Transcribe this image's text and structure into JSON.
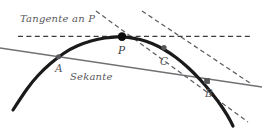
{
  "figure": {
    "title_text": "Tangente an P",
    "secant_text": "Sekante",
    "width": 262,
    "height": 129,
    "background": "#ffffff"
  },
  "labels": {
    "tangente": "Tangente an P",
    "sekante": "Sekante",
    "point_p": "P",
    "point_a": "A",
    "point_b": "B",
    "point_c": "C"
  },
  "colors": {
    "curve": "#1a1a1a",
    "secant": "#6f7174",
    "dashed": "#5d5e61",
    "tangent_dash": "#3c3d3f",
    "label": "#58595b",
    "point_fill_major": "#0d0d0d",
    "point_fill_minor": "#55575a"
  },
  "chart_data": {
    "type": "line",
    "title": "Tangente an P",
    "xlabel": "",
    "ylabel": "",
    "xlim": [
      0,
      262
    ],
    "ylim": [
      129,
      0
    ],
    "grid": false,
    "legend": null,
    "series": [
      {
        "name": "Kurve",
        "kind": "curve",
        "style": "solid",
        "width": 3.2,
        "color": "#1a1a1a",
        "points": [
          [
            13,
            110
          ],
          [
            22,
            96
          ],
          [
            32,
            82
          ],
          [
            44,
            69
          ],
          [
            57,
            58
          ],
          [
            70,
            49
          ],
          [
            84,
            43
          ],
          [
            98,
            39
          ],
          [
            112,
            37
          ],
          [
            122,
            36.6
          ],
          [
            134,
            38
          ],
          [
            146,
            41
          ],
          [
            158,
            46
          ],
          [
            170,
            53
          ],
          [
            182,
            62
          ],
          [
            194,
            73
          ],
          [
            206,
            86
          ],
          [
            218,
            101
          ],
          [
            228,
            116
          ],
          [
            233,
            126
          ]
        ]
      },
      {
        "name": "Tangente an P",
        "kind": "line",
        "style": "dashed",
        "width": 1.3,
        "dash": "5,3.4",
        "color": "#3c3d3f",
        "points": [
          [
            18,
            36.4
          ],
          [
            250,
            36.4
          ]
        ]
      },
      {
        "name": "Sekante AB",
        "kind": "line",
        "style": "solid",
        "width": 1.5,
        "color": "#6f7174",
        "points": [
          [
            0,
            48
          ],
          [
            262,
            87
          ]
        ]
      },
      {
        "name": "Sekante PC (gestrichelt)",
        "kind": "line",
        "style": "dashed",
        "width": 1.25,
        "dash": "4.6,3.2",
        "color": "#5d5e61",
        "points": [
          [
            96,
            11
          ],
          [
            248,
            122
          ]
        ]
      },
      {
        "name": "Sekante PB (gestrichelt)",
        "kind": "line",
        "style": "dashed",
        "width": 1.25,
        "dash": "4.6,3.2",
        "color": "#5d5e61",
        "points": [
          [
            142,
            11
          ],
          [
            250,
            83
          ]
        ]
      }
    ],
    "points": [
      {
        "label": "P",
        "x": 122,
        "y": 36.6,
        "radius": 4.3,
        "fill": "#0d0d0d",
        "shape": "circle"
      },
      {
        "label": "C",
        "x": 164,
        "y": 47.6,
        "radius": 2.6,
        "fill": "#55575a",
        "shape": "circle"
      },
      {
        "label": "A",
        "x": 58.5,
        "y": 56.8,
        "radius": 2.5,
        "fill": "#55575a",
        "shape": "circle"
      },
      {
        "label": "B",
        "x": 207,
        "y": 81.0,
        "radius": 2.9,
        "fill": "#55575a",
        "shape": "square"
      }
    ],
    "annotations": [
      {
        "text": "Tangente an P",
        "x": 20,
        "y": 24
      },
      {
        "text": "Sekante",
        "x": 70,
        "y": 82
      },
      {
        "text": "P",
        "x": 118,
        "y": 55
      },
      {
        "text": "A",
        "x": 55,
        "y": 73
      },
      {
        "text": "B",
        "x": 205,
        "y": 98
      },
      {
        "text": "C",
        "x": 160,
        "y": 66
      }
    ]
  }
}
